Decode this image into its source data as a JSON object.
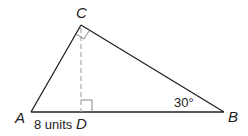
{
  "diagram": {
    "type": "right-triangle-with-altitude",
    "vertices": {
      "A": {
        "label": "A",
        "x": 31,
        "y": 112
      },
      "B": {
        "label": "B",
        "x": 224,
        "y": 112
      },
      "C": {
        "label": "C",
        "x": 81,
        "y": 25
      },
      "D": {
        "label": "D",
        "x": 81,
        "y": 112
      }
    },
    "segment_label_AD": "8 units",
    "angle_label_B": "30°",
    "right_angles": [
      "C",
      "D"
    ],
    "altitude": {
      "from": "C",
      "to": "D",
      "style": "dashed"
    },
    "colors": {
      "line": "#222222",
      "altitude": "#aaaaaa",
      "right_angle_mark": "#888888"
    }
  }
}
